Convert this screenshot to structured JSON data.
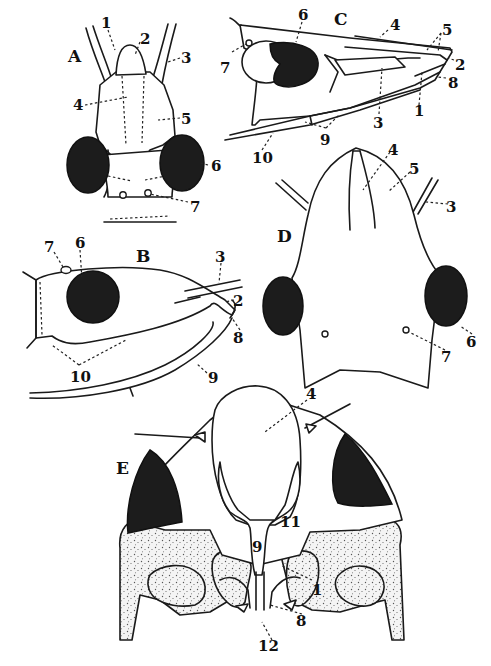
{
  "figure": {
    "background": "#ffffff",
    "ink_color": "#1a1a1a",
    "eye_color": "#1c1c1c"
  },
  "panels": {
    "A": {
      "letter": "A",
      "view": "dorsal view of narrow head",
      "labels": [
        "1",
        "2",
        "3",
        "4",
        "5",
        "6",
        "7"
      ]
    },
    "B": {
      "letter": "B",
      "view": "lateral view of head",
      "labels": [
        "7",
        "6",
        "3",
        "2",
        "8",
        "10",
        "9"
      ]
    },
    "C": {
      "letter": "C",
      "view": "lateral view of elongated pointed head",
      "labels": [
        "6",
        "4",
        "5",
        "7",
        "2",
        "8",
        "1",
        "3",
        "9",
        "10"
      ]
    },
    "D": {
      "letter": "D",
      "view": "dorsal view of broad head",
      "labels": [
        "4",
        "5",
        "3",
        "6",
        "7"
      ]
    },
    "E": {
      "letter": "E",
      "view": "anterior view of head with thorax",
      "labels": [
        "4",
        "11",
        "9",
        "1",
        "8",
        "12"
      ]
    }
  },
  "labels": {
    "n1": "1",
    "n2": "2",
    "n3": "3",
    "n4": "4",
    "n5": "5",
    "n6": "6",
    "n7": "7",
    "n8": "8",
    "n9": "9",
    "n10": "10",
    "n11": "11",
    "n12": "12"
  }
}
